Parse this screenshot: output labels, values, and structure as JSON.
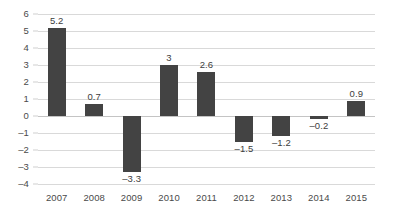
{
  "chart_data": {
    "type": "bar",
    "title": "",
    "subtitle": "",
    "xlabel": "",
    "ylabel": "",
    "categories": [
      "2007",
      "2008",
      "2009",
      "2010",
      "2011",
      "2012",
      "2013",
      "2014",
      "2015"
    ],
    "values": [
      5.2,
      0.7,
      -3.3,
      3,
      2.6,
      -1.5,
      -1.2,
      -0.2,
      0.9
    ],
    "data_labels": [
      "5.2",
      "0.7",
      "–3.3",
      "3",
      "2.6",
      "–1.5",
      "–1.2",
      "–0.2",
      "0.9"
    ],
    "ylim": [
      -4,
      6
    ],
    "ytick_step": 1,
    "ytick_labels": [
      "6",
      "5",
      "4",
      "3",
      "2",
      "1",
      "0",
      "–1",
      "–2",
      "–3",
      "–4"
    ],
    "ytick_values": [
      6,
      5,
      4,
      3,
      2,
      1,
      0,
      -1,
      -2,
      -3,
      -4
    ],
    "grid": "horizontal",
    "legend": "none",
    "bar_color": "#434343",
    "gridline_color": "#d9d9d9",
    "zero_line_color": "#c4c4c4",
    "text_color": "#4a4a4a",
    "background_color": "#ffffff"
  }
}
